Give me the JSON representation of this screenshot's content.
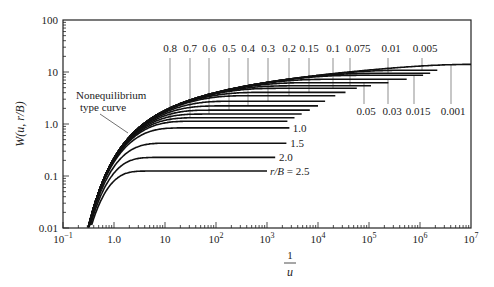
{
  "chart_data": {
    "type": "line",
    "title": "",
    "xlabel": "1/u",
    "ylabel": "W(u, r/B)",
    "xscale": "log",
    "yscale": "log",
    "xlim": [
      0.1,
      10000000
    ],
    "ylim": [
      0.01,
      100
    ],
    "grid": false,
    "x_ticks": [
      {
        "value": 0.1,
        "base": "10",
        "exp": "−1"
      },
      {
        "value": 1,
        "label": "1.0"
      },
      {
        "value": 10,
        "label": "10"
      },
      {
        "value": 100,
        "base": "10",
        "exp": "2"
      },
      {
        "value": 1000,
        "base": "10",
        "exp": "3"
      },
      {
        "value": 10000,
        "base": "10",
        "exp": "4"
      },
      {
        "value": 100000,
        "base": "10",
        "exp": "5"
      },
      {
        "value": 1000000,
        "base": "10",
        "exp": "6"
      },
      {
        "value": 10000000,
        "base": "10",
        "exp": "7"
      }
    ],
    "y_ticks": [
      {
        "value": 100,
        "label": "100"
      },
      {
        "value": 10,
        "label": "10"
      },
      {
        "value": 1,
        "label": "1.0"
      },
      {
        "value": 0.1,
        "label": "0.1"
      },
      {
        "value": 0.01,
        "label": "0.01"
      }
    ],
    "annotation": {
      "text_line1": "Nonequilibrium",
      "text_line2": "type curve"
    },
    "series": [
      {
        "name": "r/B = 2.5",
        "r_over_B": 2.5,
        "plateau_W": 0.125,
        "x_end": 1000,
        "label": "r/B = 2.5",
        "label_pos": "right"
      },
      {
        "name": "r/B = 2.0",
        "r_over_B": 2.0,
        "plateau_W": 0.228,
        "x_end": 1500,
        "label": "2.0",
        "label_pos": "right"
      },
      {
        "name": "r/B = 1.5",
        "r_over_B": 1.5,
        "plateau_W": 0.428,
        "x_end": 2500,
        "label": "1.5",
        "label_pos": "right"
      },
      {
        "name": "r/B = 1.0",
        "r_over_B": 1.0,
        "plateau_W": 0.842,
        "x_end": 2800,
        "label": "1.0",
        "label_pos": "right"
      },
      {
        "name": "r/B = 0.8",
        "r_over_B": 0.8,
        "plateau_W": 1.13,
        "x_end": 2600,
        "label": "0.8",
        "label_pos": "top"
      },
      {
        "name": "r/B = 0.7",
        "r_over_B": 0.7,
        "plateau_W": 1.32,
        "x_end": 3500,
        "label": "0.7",
        "label_pos": "top"
      },
      {
        "name": "r/B = 0.6",
        "r_over_B": 0.6,
        "plateau_W": 1.55,
        "x_end": 5000,
        "label": "0.6",
        "label_pos": "top"
      },
      {
        "name": "r/B = 0.5",
        "r_over_B": 0.5,
        "plateau_W": 1.85,
        "x_end": 7000,
        "label": "0.5",
        "label_pos": "top"
      },
      {
        "name": "r/B = 0.4",
        "r_over_B": 0.4,
        "plateau_W": 2.23,
        "x_end": 10000,
        "label": "0.4",
        "label_pos": "top"
      },
      {
        "name": "r/B = 0.3",
        "r_over_B": 0.3,
        "plateau_W": 2.74,
        "x_end": 14000,
        "label": "0.3",
        "label_pos": "top"
      },
      {
        "name": "r/B = 0.2",
        "r_over_B": 0.2,
        "plateau_W": 3.51,
        "x_end": 22000,
        "label": "0.2",
        "label_pos": "top"
      },
      {
        "name": "r/B = 0.15",
        "r_over_B": 0.15,
        "plateau_W": 4.06,
        "x_end": 35000,
        "label": "0.15",
        "label_pos": "top"
      },
      {
        "name": "r/B = 0.1",
        "r_over_B": 0.1,
        "plateau_W": 4.85,
        "x_end": 60000,
        "label": "0.1",
        "label_pos": "top"
      },
      {
        "name": "r/B = 0.075",
        "r_over_B": 0.075,
        "plateau_W": 5.42,
        "x_end": 110000,
        "label": "0.075",
        "label_pos": "top"
      },
      {
        "name": "r/B = 0.05",
        "r_over_B": 0.05,
        "plateau_W": 6.23,
        "x_end": 250000,
        "label": "0.05",
        "label_pos": "bottom"
      },
      {
        "name": "r/B = 0.03",
        "r_over_B": 0.03,
        "plateau_W": 7.25,
        "x_end": 550000,
        "label": "0.03",
        "label_pos": "bottom"
      },
      {
        "name": "r/B = 0.015",
        "r_over_B": 0.015,
        "plateau_W": 8.63,
        "x_end": 1200000,
        "label": "0.015",
        "label_pos": "bottom"
      },
      {
        "name": "r/B = 0.01",
        "r_over_B": 0.01,
        "plateau_W": 9.44,
        "x_end": 1600000,
        "label": "0.01",
        "label_pos": "top"
      },
      {
        "name": "r/B = 0.005",
        "r_over_B": 0.005,
        "plateau_W": 10.83,
        "x_end": 2200000,
        "label": "0.005",
        "label_pos": "top"
      },
      {
        "name": "r/B = 0.001",
        "r_over_B": 0.001,
        "plateau_W": 14.05,
        "x_end": 10000000,
        "label": "0.001",
        "label_pos": "bottom"
      }
    ],
    "top_labels": [
      {
        "text": "0.8",
        "x": 170,
        "lx": 170
      },
      {
        "text": "0.7",
        "x": 190,
        "lx": 190
      },
      {
        "text": "0.6",
        "x": 209,
        "lx": 209
      },
      {
        "text": "0.5",
        "x": 229,
        "lx": 229
      },
      {
        "text": "0.4",
        "x": 248,
        "lx": 248
      },
      {
        "text": "0.3",
        "x": 268,
        "lx": 268
      },
      {
        "text": "0.2",
        "x": 289,
        "lx": 289
      },
      {
        "text": "0.15",
        "x": 309,
        "lx": 309
      },
      {
        "text": "0.1",
        "x": 333,
        "lx": 333
      },
      {
        "text": "0.075",
        "x": 358,
        "lx": 350
      },
      {
        "text": "0.01",
        "x": 391,
        "lx": 388
      },
      {
        "text": "0.005",
        "x": 425,
        "lx": 422
      }
    ],
    "bottom_labels": [
      {
        "text": "0.05",
        "x": 366,
        "lx": 364
      },
      {
        "text": "0.03",
        "x": 392,
        "lx": 388
      },
      {
        "text": "0.015",
        "x": 418,
        "lx": 414
      },
      {
        "text": "0.001",
        "x": 453,
        "lx": 451
      }
    ]
  }
}
